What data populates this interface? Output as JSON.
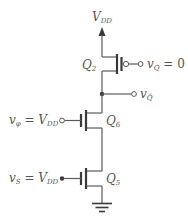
{
  "diagram": {
    "type": "cmos-circuit-schematic",
    "supply": {
      "label": "V",
      "label_sub": "DD"
    },
    "transistors": [
      {
        "id": "Q2",
        "label": "Q",
        "label_sub": "2",
        "type": "PMOS"
      },
      {
        "id": "Q6",
        "label": "Q",
        "label_sub": "6",
        "type": "NMOS"
      },
      {
        "id": "Q5",
        "label": "Q",
        "label_sub": "5",
        "type": "NMOS"
      }
    ],
    "terminals": {
      "q_input": {
        "var": "v",
        "var_sub": "Q",
        "value_text": " = 0"
      },
      "q_bar_output": {
        "var": "v",
        "var_sub": "Q̄"
      },
      "phi_input": {
        "var": "v",
        "var_sub": "φ",
        "eq_text": " = V",
        "eq_sub": "DD"
      },
      "s_input": {
        "var": "v",
        "var_sub": "S",
        "eq_text": " = V",
        "eq_sub": "DD"
      }
    },
    "ground": {
      "label": "ground"
    },
    "colors": {
      "wire": "#5a5a5a",
      "device": "#3a3a3a",
      "text": "#555555"
    }
  }
}
